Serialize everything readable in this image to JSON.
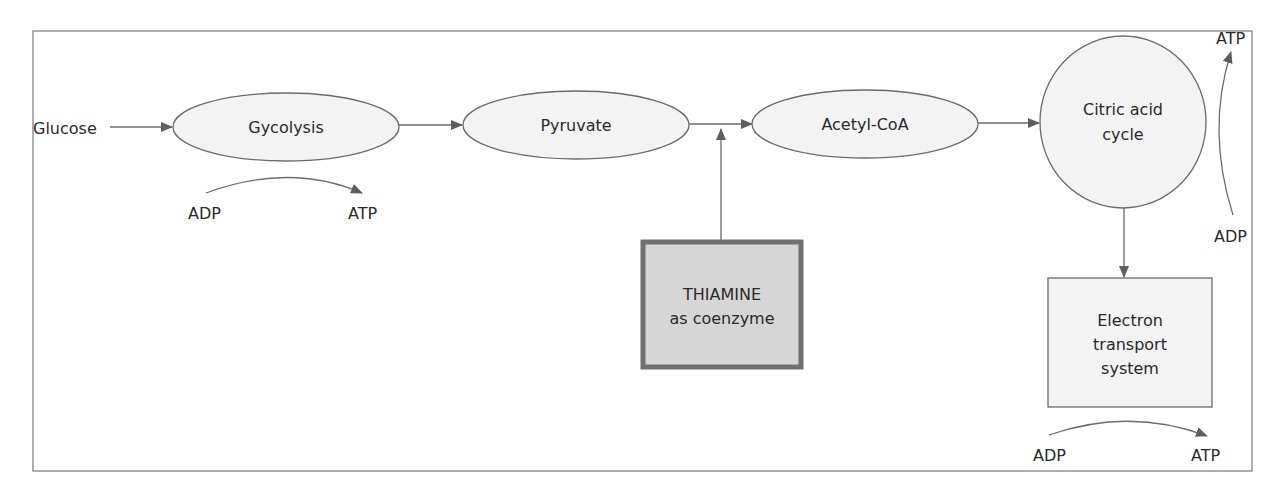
{
  "diagram": {
    "colors": {
      "frame": "#7a7a7a",
      "stroke": "#6b6b6b",
      "node_fill": "#f3f3f3",
      "thiamine_fill": "#d6d6d6",
      "thiamine_border": "#707070",
      "arrow": "#5e5e5e",
      "text": "#2a2a2a"
    },
    "input": {
      "label": "Glucose"
    },
    "nodes": {
      "glycolysis": {
        "label": "Gycolysis",
        "shape": "ellipse"
      },
      "pyruvate": {
        "label": "Pyruvate",
        "shape": "ellipse"
      },
      "acetyl_coa": {
        "label": "Acetyl-CoA",
        "shape": "ellipse"
      },
      "citric_acid": {
        "line1": "Citric acid",
        "line2": "cycle",
        "shape": "circle"
      },
      "electron_transport": {
        "line1": "Electron",
        "line2": "transport",
        "line3": "system",
        "shape": "rectangle"
      },
      "thiamine": {
        "line1": "THIAMINE",
        "line2": "as coenzyme",
        "shape": "rectangle-bold"
      }
    },
    "energy_conversions": {
      "glycolysis": {
        "from": "ADP",
        "to": "ATP"
      },
      "citric_acid": {
        "from": "ADP",
        "to": "ATP"
      },
      "electron_transport": {
        "from": "ADP",
        "to": "ATP"
      }
    },
    "edges": [
      {
        "from": "Glucose",
        "to": "Gycolysis"
      },
      {
        "from": "Gycolysis",
        "to": "Pyruvate"
      },
      {
        "from": "Pyruvate",
        "to": "Acetyl-CoA"
      },
      {
        "from": "THIAMINE as coenzyme",
        "to": "Pyruvate → Acetyl-CoA"
      },
      {
        "from": "Acetyl-CoA",
        "to": "Citric acid cycle"
      },
      {
        "from": "Citric acid cycle",
        "to": "Electron transport system"
      }
    ]
  }
}
